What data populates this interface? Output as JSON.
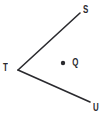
{
  "figure": {
    "kind": "geometry-angle-diagram",
    "background_color": "#ffffff",
    "stroke_color": "#2a2a2e",
    "stroke_width": 1.6,
    "width": 105,
    "height": 117,
    "vertex_label": "T",
    "ray_labels": [
      "S",
      "U"
    ],
    "interior_point_label": "Q",
    "labels": {
      "S": "S",
      "T": "T",
      "U": "U",
      "Q": "Q"
    },
    "points": {
      "T": {
        "x": 18,
        "y": 70
      },
      "S": {
        "x": 80,
        "y": 13
      },
      "U": {
        "x": 90,
        "y": 102
      },
      "Q": {
        "x": 63,
        "y": 63
      }
    },
    "segments": [
      {
        "name": "ray-TS",
        "from": "T",
        "to": "S"
      },
      {
        "name": "ray-TU",
        "from": "T",
        "to": "U"
      }
    ],
    "marker": {
      "name": "point-Q-dot",
      "radius": 2.2,
      "fill": "#2a2a2e"
    }
  }
}
